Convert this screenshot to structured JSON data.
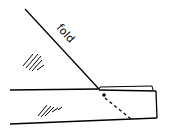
{
  "diagram": {
    "fold_label": "fold",
    "colors": {
      "ink": "#000000",
      "background": "#ffffff"
    }
  }
}
